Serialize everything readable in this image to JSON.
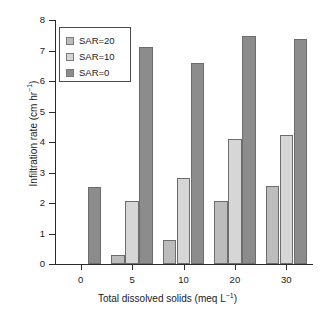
{
  "chart_data": {
    "type": "bar",
    "title": "",
    "xlabel": "Total dissolved solids (meq L⁻¹)",
    "ylabel": "Infiltration rate (cm hr⁻¹)",
    "categories": [
      "0",
      "5",
      "10",
      "20",
      "30"
    ],
    "ylim": [
      0,
      8
    ],
    "yticks": [
      "0",
      "1",
      "2",
      "3",
      "4",
      "5",
      "6",
      "7",
      "8"
    ],
    "grid": false,
    "legend_position": "top-left",
    "series": [
      {
        "name": "SAR=20",
        "color": "#bcbcbc",
        "values": [
          null,
          0.3,
          0.78,
          2.08,
          2.55
        ]
      },
      {
        "name": "SAR=10",
        "color": "#d6d6d6",
        "values": [
          null,
          2.05,
          2.82,
          4.1,
          4.22
        ]
      },
      {
        "name": "SAR=0",
        "color": "#8c8c8c",
        "values": [
          2.52,
          7.1,
          6.6,
          7.47,
          7.38
        ]
      }
    ]
  },
  "axes": {
    "x_title_main": "Total dissolved solids (meq L",
    "x_title_sup": "−1",
    "x_title_tail": ")",
    "y_title_main": "Infiltration rate (cm hr",
    "y_title_sup": "−1",
    "y_title_tail": ")"
  },
  "legend": {
    "items": [
      {
        "label": "SAR=20",
        "swatch": "#bcbcbc"
      },
      {
        "label": "SAR=10",
        "swatch": "#d6d6d6"
      },
      {
        "label": "SAR=0",
        "swatch": "#8c8c8c"
      }
    ]
  }
}
